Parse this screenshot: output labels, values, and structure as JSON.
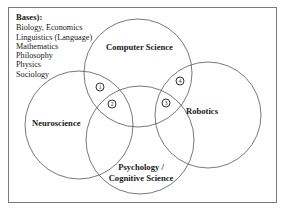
{
  "diagram": {
    "type": "venn",
    "bases": {
      "title": "Bases):",
      "items": [
        "Biology, Economics",
        "Linguistics (Language)",
        "Mathematics",
        "Philosophy",
        "Physics",
        "Sociology"
      ]
    },
    "circles": [
      {
        "id": "computer-science",
        "label": "Computer Science",
        "cx": 138,
        "cy": 73,
        "r": 54
      },
      {
        "id": "neuroscience",
        "label": "Neuroscience",
        "cx": 79,
        "cy": 125,
        "r": 54
      },
      {
        "id": "psychology",
        "label_line1": "Psychology /",
        "label_line2": "Cognitive Science",
        "cx": 140,
        "cy": 140,
        "r": 54
      },
      {
        "id": "robotics",
        "label": "Robotics",
        "cx": 208,
        "cy": 115,
        "r": 53
      }
    ],
    "markers": [
      {
        "number": "1",
        "x": 100,
        "y": 87
      },
      {
        "number": "2",
        "x": 112,
        "y": 104
      },
      {
        "number": "3",
        "x": 166,
        "y": 103
      },
      {
        "number": "4",
        "x": 180,
        "y": 81
      }
    ],
    "colors": {
      "stroke": "#555555",
      "text": "#1a1a1a",
      "frame": "#7a7a7a"
    }
  }
}
